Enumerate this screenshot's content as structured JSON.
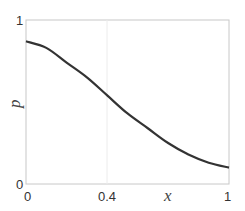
{
  "chart_data": {
    "type": "line",
    "title": "",
    "xlabel": "x",
    "ylabel": "p",
    "xlim": [
      0,
      1
    ],
    "ylim": [
      0,
      1
    ],
    "x_ticks": [
      "0",
      "0.4",
      "1"
    ],
    "y_ticks": [
      "0",
      "1"
    ],
    "grid": "vertical line at x=0.4",
    "series": [
      {
        "name": "p(x)",
        "x": [
          0,
          0.1,
          0.2,
          0.3,
          0.4,
          0.5,
          0.6,
          0.7,
          0.8,
          0.9,
          1.0
        ],
        "values": [
          0.87,
          0.83,
          0.74,
          0.65,
          0.54,
          0.43,
          0.34,
          0.25,
          0.18,
          0.13,
          0.1
        ]
      }
    ]
  },
  "labels": {
    "x_axis": "x",
    "y_axis": "p",
    "x_tick_0": "0",
    "x_tick_04": "0.4",
    "x_tick_1": "1",
    "y_tick_0": "0",
    "y_tick_1": "1"
  }
}
